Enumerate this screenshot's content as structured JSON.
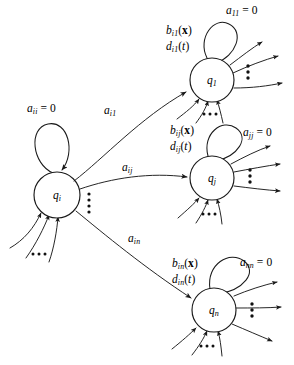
{
  "figure": {
    "type": "state-transition-diagram",
    "title": "",
    "background_color": "#ffffff",
    "stroke_color": "#1a1a1a",
    "width": 294,
    "height": 365
  },
  "nodes": [
    {
      "id": "q-i",
      "label_base": "q",
      "label_sub": "i",
      "cx": 57,
      "cy": 195,
      "r": 23,
      "self_loop_label": "a",
      "self_loop_sub": "ii",
      "self_loop_value": "= 0",
      "incoming_count": 3,
      "outgoing_fan_count": 3
    },
    {
      "id": "q-1",
      "label_base": "q",
      "label_sub": "1",
      "cx": 212,
      "cy": 80,
      "r": 22,
      "self_loop_label": "a",
      "self_loop_sub": "11",
      "self_loop_value": "= 0",
      "rate_label": "b",
      "rate_sub": "i1",
      "rate_arg": "(x)",
      "delay_label": "d",
      "delay_sub": "i1",
      "delay_arg": "(t)",
      "incoming_count": 3,
      "outgoing_count": 3
    },
    {
      "id": "q-j",
      "label_base": "q",
      "label_sub": "j",
      "cx": 212,
      "cy": 178,
      "r": 22,
      "self_loop_label": "a",
      "self_loop_sub": "jj",
      "self_loop_value": "= 0",
      "rate_label": "b",
      "rate_sub": "ij",
      "rate_arg": "(x)",
      "delay_label": "d",
      "delay_sub": "ij",
      "delay_arg": "(t)",
      "incoming_count": 3,
      "outgoing_count": 3
    },
    {
      "id": "q-n",
      "label_base": "q",
      "label_sub": "n",
      "cx": 214,
      "cy": 310,
      "r": 22,
      "self_loop_label": "a",
      "self_loop_sub": "nn",
      "self_loop_value": "= 0",
      "rate_label": "b",
      "rate_sub": "in",
      "rate_arg": "(x)",
      "delay_label": "d",
      "delay_sub": "in",
      "delay_arg": "(t)",
      "incoming_count": 3,
      "outgoing_count": 3
    }
  ],
  "transitions": [
    {
      "id": "edge-i-to-1",
      "from": "q-i",
      "to": "q-1",
      "label_base": "a",
      "label_sub": "i1"
    },
    {
      "id": "edge-i-to-j",
      "from": "q-i",
      "to": "q-j",
      "label_base": "a",
      "label_sub": "ij"
    },
    {
      "id": "edge-i-to-n",
      "from": "q-i",
      "to": "q-n",
      "label_base": "a",
      "label_sub": "in"
    }
  ],
  "labels": {
    "a11_zero": {
      "base": "a",
      "sub": "11",
      "value": "= 0"
    },
    "ajj_zero": {
      "base": "a",
      "sub": "jj",
      "value": "= 0"
    },
    "ann_zero": {
      "base": "a",
      "sub": "nn",
      "value": "= 0"
    },
    "aii_zero": {
      "base": "a",
      "sub": "ii",
      "value": "= 0"
    },
    "b_i1": {
      "base": "b",
      "sub": "i1",
      "arg": "(x)"
    },
    "d_i1": {
      "base": "d",
      "sub": "i1",
      "arg": "(t)"
    },
    "b_ij": {
      "base": "b",
      "sub": "ij",
      "arg": "(x)"
    },
    "d_ij": {
      "base": "d",
      "sub": "ij",
      "arg": "(t)"
    },
    "b_in": {
      "base": "b",
      "sub": "in",
      "arg": "(x)"
    },
    "d_in": {
      "base": "d",
      "sub": "in",
      "arg": "(t)"
    },
    "a_i1": {
      "base": "a",
      "sub": "i1"
    },
    "a_ij": {
      "base": "a",
      "sub": "ij"
    },
    "a_in": {
      "base": "a",
      "sub": "in"
    },
    "q_i": {
      "base": "q",
      "sub": "i"
    },
    "q_1": {
      "base": "q",
      "sub": "1"
    },
    "q_j": {
      "base": "q",
      "sub": "j"
    },
    "q_n": {
      "base": "q",
      "sub": "n"
    }
  },
  "ellipses": [
    {
      "id": "ellipsis-qi-in",
      "orientation": "horizontal",
      "dots": 3
    },
    {
      "id": "ellipsis-qi-out",
      "orientation": "vertical",
      "dots": 4
    },
    {
      "id": "ellipsis-q1-in",
      "orientation": "horizontal",
      "dots": 3
    },
    {
      "id": "ellipsis-q1-out",
      "orientation": "vertical",
      "dots": 3
    },
    {
      "id": "ellipsis-qj-in",
      "orientation": "horizontal",
      "dots": 3
    },
    {
      "id": "ellipsis-qj-out",
      "orientation": "vertical",
      "dots": 3
    },
    {
      "id": "ellipsis-qn-in",
      "orientation": "horizontal",
      "dots": 3
    },
    {
      "id": "ellipsis-qn-out",
      "orientation": "vertical",
      "dots": 3
    }
  ]
}
